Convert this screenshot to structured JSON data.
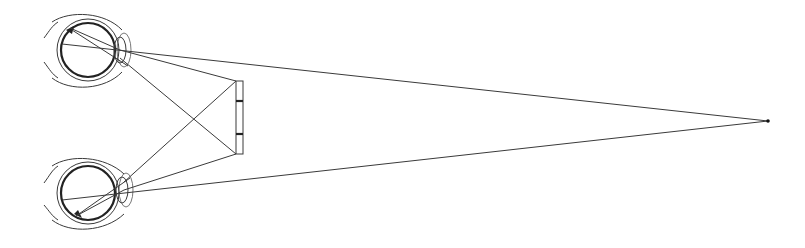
{
  "diagram": {
    "type": "binocular-vision-illustration",
    "colors": {
      "line": "#3a3a3a",
      "background": "#ffffff"
    },
    "eyes": [
      {
        "name": "top-eye",
        "center": [
          88,
          50
        ],
        "lens": [
          120,
          50
        ]
      },
      {
        "name": "bottom-eye",
        "center": [
          88,
          193
        ],
        "lens": [
          123,
          188
        ]
      }
    ],
    "screen": {
      "x": 236,
      "y": 81,
      "width": 7,
      "height": 73,
      "dividers": [
        101,
        134
      ]
    },
    "fixation_point": [
      768,
      121
    ]
  }
}
